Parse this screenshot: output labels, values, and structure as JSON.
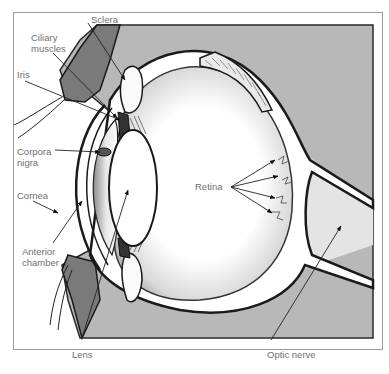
{
  "figure": {
    "labels": {
      "sclera": "Sclera",
      "ciliary_muscles": "Ciliary\nmuscles",
      "iris": "Iris",
      "corpora_nigra": "Corpora\nnigra",
      "cornea": "Cornea",
      "anterior_chamber": "Anterior\nchamber",
      "lens": "Lens",
      "retina": "Retina",
      "optic_nerve": "Optic nerve"
    }
  },
  "colors": {
    "background": "#ffffff",
    "frame_border": "#9a9a9a",
    "tissue_shade": "#b8b8b8",
    "dark_tissue": "#7a7a7a",
    "outline": "#1a1a1a",
    "label_text": "#6f6f6f"
  }
}
